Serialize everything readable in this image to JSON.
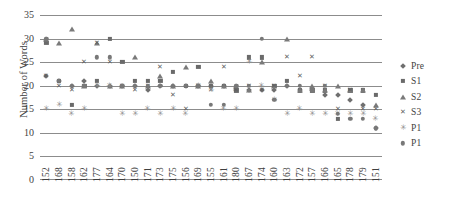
{
  "chart_data": {
    "type": "scatter",
    "title": "",
    "xlabel": "",
    "ylabel": "Number of Words",
    "ylim": [
      0,
      35
    ],
    "ytick_step": 5,
    "yticks": [
      35,
      30,
      25,
      20,
      15,
      10,
      5,
      0
    ],
    "grid": true,
    "legend_position": "right",
    "categories": [
      "152",
      "168",
      "158",
      "162",
      "177",
      "164",
      "170",
      "150",
      "171",
      "173",
      "175",
      "156",
      "169",
      "155",
      "161",
      "180",
      "167",
      "174",
      "160",
      "163",
      "172",
      "157",
      "166",
      "165",
      "178",
      "179",
      "151"
    ],
    "series": [
      {
        "name": "Pre",
        "marker": "diamond",
        "color": "#6f6f6f",
        "values": [
          22,
          21,
          20,
          21,
          20,
          20,
          20,
          20,
          19,
          20,
          20,
          20,
          20,
          20,
          20,
          19,
          19,
          19,
          19,
          20,
          19,
          19,
          18,
          18,
          17,
          16,
          11
        ]
      },
      {
        "name": "S1",
        "marker": "square",
        "color": "#6a6a6a",
        "values": [
          29,
          21,
          16,
          20,
          21,
          30,
          25,
          21,
          21,
          21,
          23,
          20,
          24,
          20,
          20,
          19,
          26,
          26,
          20,
          21,
          19,
          19,
          19,
          13,
          19,
          19,
          18
        ]
      },
      {
        "name": "S2",
        "marker": "triangle",
        "color": "#7a7a7a",
        "values": [
          30,
          29,
          32,
          20,
          29,
          20,
          20,
          26,
          20,
          22,
          20,
          24,
          20,
          21,
          20,
          20,
          19,
          25,
          20,
          30,
          19,
          20,
          19,
          20,
          19,
          19,
          16
        ]
      },
      {
        "name": "S3",
        "marker": "cross",
        "color": "#5e5e5e",
        "values": [
          22,
          20,
          19,
          25,
          29,
          25,
          20,
          19,
          20,
          24,
          18,
          15,
          20,
          19,
          24,
          19,
          20,
          19,
          20,
          26,
          22,
          26,
          20,
          15,
          19,
          15,
          15
        ]
      },
      {
        "name": "P1",
        "marker": "star",
        "color": "#8d8d8d",
        "values": [
          15,
          16,
          14,
          15,
          20,
          20,
          14,
          14,
          15,
          14,
          15,
          14,
          20,
          19,
          15,
          15,
          25,
          20,
          17,
          14,
          15,
          14,
          14,
          14,
          14,
          14,
          13
        ]
      },
      {
        "name": "P1",
        "marker": "circle",
        "color": "#787878",
        "values": [
          30,
          21,
          20,
          20,
          26,
          26,
          20,
          20,
          20,
          20,
          20,
          20,
          20,
          16,
          16,
          20,
          20,
          30,
          17,
          20,
          20,
          19,
          20,
          14,
          13,
          13,
          11
        ]
      }
    ]
  }
}
